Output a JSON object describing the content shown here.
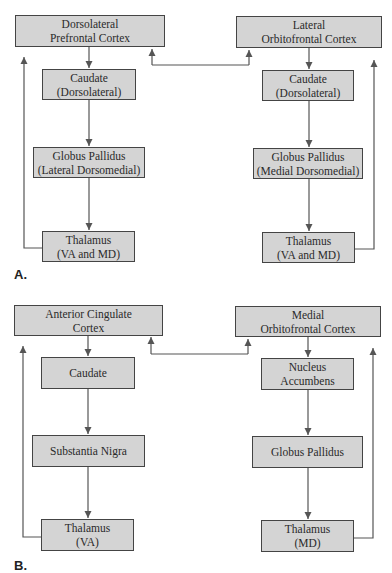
{
  "panels": [
    {
      "label": "A.",
      "left_loop": {
        "cortex": [
          "Dorsolateral",
          "Prefrontal Cortex"
        ],
        "striatum": [
          "Caudate",
          "(Dorsolateral)"
        ],
        "pallidum": [
          "Globus Pallidus",
          "(Lateral Dorsomedial)"
        ],
        "thalamus": [
          "Thalamus",
          "(VA and MD)"
        ]
      },
      "right_loop": {
        "cortex": [
          "Lateral",
          "Orbitofrontal Cortex"
        ],
        "striatum": [
          "Caudate",
          "(Dorsolateral)"
        ],
        "pallidum": [
          "Globus Pallidus",
          "(Medial Dorsomedial)"
        ],
        "thalamus": [
          "Thalamus",
          "(VA and MD)"
        ]
      }
    },
    {
      "label": "B.",
      "left_loop": {
        "cortex": [
          "Anterior Cingulate",
          "Cortex"
        ],
        "striatum": [
          "Caudate"
        ],
        "pallidum": [
          "Substantia Nigra"
        ],
        "thalamus": [
          "Thalamus",
          "(VA)"
        ]
      },
      "right_loop": {
        "cortex": [
          "Medial",
          "Orbitofrontal Cortex"
        ],
        "striatum": [
          "Nucleus",
          "Accumbens"
        ],
        "pallidum": [
          "Globus Pallidus"
        ],
        "thalamus": [
          "Thalamus",
          "(MD)"
        ]
      }
    }
  ],
  "colors": {
    "box_fill": "#d4d4d4",
    "box_border": "#444444",
    "line": "#555555"
  }
}
